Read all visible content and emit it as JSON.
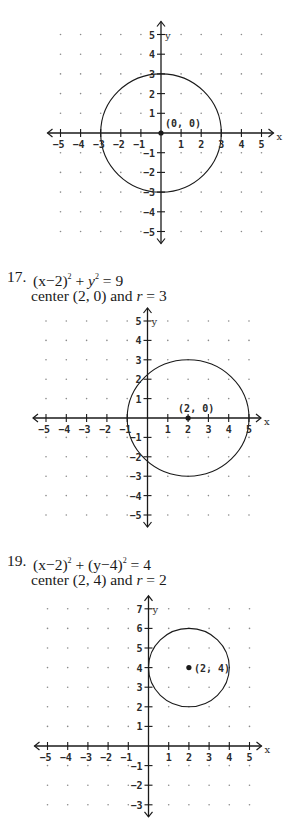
{
  "graphs": [
    {
      "id": "graph-15",
      "top": 20,
      "height": 228,
      "origin": [
        161,
        133
      ],
      "unit_x": 20.1,
      "unit_y": 19.7,
      "x_range": [
        -5,
        5
      ],
      "y_range": [
        -5,
        5
      ],
      "x_axis_label": "x",
      "y_axis_label": "y",
      "circle": {
        "cx": 0,
        "cy": 0,
        "r": 3
      },
      "center_point": {
        "x": 0,
        "y": 0,
        "label": "(0, 0)"
      }
    },
    {
      "id": "graph-17",
      "top": 305,
      "height": 225,
      "origin": [
        147.5,
        418
      ],
      "unit_x": 20.3,
      "unit_y": 19.4,
      "x_range": [
        -5,
        5
      ],
      "y_range": [
        -5,
        5
      ],
      "x_axis_label": "x",
      "y_axis_label": "y",
      "circle": {
        "cx": 2,
        "cy": 0,
        "r": 3
      },
      "center_point": {
        "x": 2,
        "y": 0,
        "label": "(2, 0)"
      }
    },
    {
      "id": "graph-19",
      "top": 594,
      "height": 226,
      "origin": [
        148.5,
        746
      ],
      "unit_x": 20.2,
      "unit_y": 19.6,
      "x_range": [
        -5,
        5
      ],
      "y_range": [
        -3,
        7
      ],
      "x_axis_label": "x",
      "y_axis_label": "y",
      "circle": {
        "cx": 2,
        "cy": 4,
        "r": 2
      },
      "center_point": {
        "x": 2,
        "y": 4,
        "label": "(2, 4)"
      }
    }
  ],
  "problems": [
    {
      "id": "problem-17",
      "top": 268,
      "number": "17.",
      "equation": {
        "lhs_1": "(x−2)",
        "exp_1": "2",
        "mid": " + ",
        "var_2": "y",
        "exp_2": "2",
        "rhs": " = 9"
      },
      "center_text": "center (2, 0) and ",
      "r_symbol": "r",
      "r_value": " = 3"
    },
    {
      "id": "problem-19",
      "top": 552,
      "number": "19.",
      "equation": {
        "lhs_1": "(x−2)",
        "exp_1": "2",
        "mid": " + ",
        "var_2": "(y−4)",
        "exp_2": "2",
        "rhs": " = 4"
      },
      "center_text": "center (2, 4) and ",
      "r_symbol": "r",
      "r_value": " = 2"
    }
  ],
  "colors": {
    "ink": "#1a1a1a",
    "grid_dot": "#8a8a8a",
    "background": "#ffffff"
  }
}
